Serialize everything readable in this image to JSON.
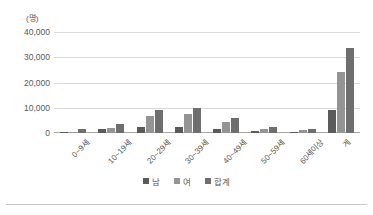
{
  "chart_data": {
    "type": "bar",
    "title": "",
    "subtitle": "",
    "xlabel": "",
    "ylabel": "",
    "unit_label": "(명)",
    "categories": [
      "0~9세",
      "10~19세",
      "20~29세",
      "30~39세",
      "40~49세",
      "50~59세",
      "60세이상",
      "계"
    ],
    "series": [
      {
        "name": "남",
        "color": "#5b5b5b",
        "values": [
          560,
          1750,
          2450,
          2250,
          1400,
          750,
          350,
          9300
        ]
      },
      {
        "name": "여",
        "color": "#949494",
        "values": [
          600,
          2050,
          6900,
          7350,
          4550,
          1400,
          1000,
          24000
        ]
      },
      {
        "name": "합계",
        "color": "#6e6e6e",
        "values": [
          1500,
          3600,
          9300,
          9800,
          5900,
          2200,
          1400,
          33500
        ]
      }
    ],
    "ylim": [
      0,
      40000
    ],
    "yticks": [
      0,
      10000,
      20000,
      30000,
      40000
    ],
    "ytick_labels": [
      "0",
      "10,000",
      "20,000",
      "30,000",
      "40,000"
    ],
    "grid": true,
    "legend_position": "bottom",
    "orientation": "vertical",
    "background": "#ffffff",
    "gridline_color": "#d9d9d9",
    "axis_color": "#a6a6a6",
    "text_color": "#595959"
  }
}
